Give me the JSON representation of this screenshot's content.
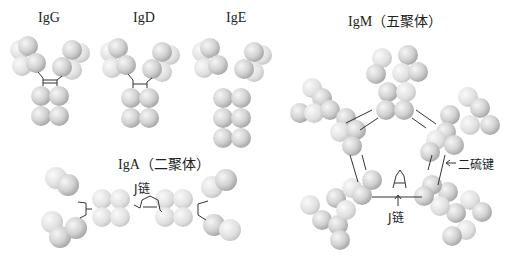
{
  "labels": {
    "igg": "IgG",
    "igd": "IgD",
    "ige": "IgE",
    "igm": "IgM（五聚体）",
    "iga": "IgA（二聚体）",
    "j_chain_iga": "J链",
    "j_chain_igm": "J链",
    "disulfide": "二硫键"
  },
  "colors": {
    "domain_light": "#f4f4f4",
    "domain_dark": "#9a9a9a",
    "bond": "#333333"
  }
}
